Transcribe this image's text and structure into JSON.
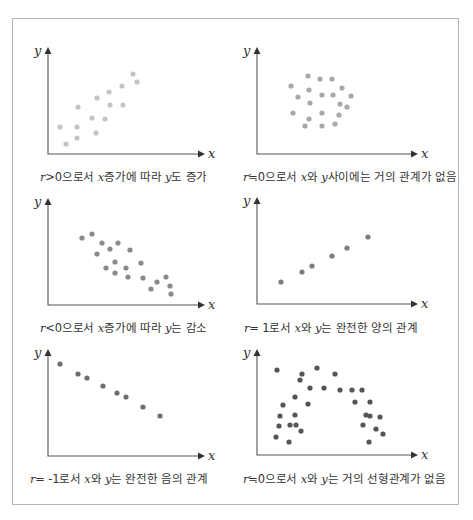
{
  "chart_data": [
    {
      "type": "scatter",
      "id": "panel1",
      "title": "",
      "xlabel": "x",
      "ylabel": "y",
      "caption": "r>0으로서 x증가에 따라 y도 증가",
      "dot_color": "#c4c4c4",
      "points": [
        [
          60,
          127
        ],
        [
          66,
          144
        ],
        [
          77,
          127
        ],
        [
          77,
          138
        ],
        [
          78,
          107
        ],
        [
          92,
          118
        ],
        [
          96,
          133
        ],
        [
          97,
          98
        ],
        [
          105,
          119
        ],
        [
          109,
          92
        ],
        [
          110,
          105
        ],
        [
          123,
          105
        ],
        [
          122,
          86
        ],
        [
          133,
          74
        ],
        [
          137,
          82
        ]
      ]
    },
    {
      "type": "scatter",
      "id": "panel2",
      "xlabel": "x",
      "ylabel": "y",
      "caption": "r≒0으로서 x와 y사이에는 거의 관계가 없음",
      "dot_color": "#a8a8a8",
      "points": [
        [
          291,
          86
        ],
        [
          308,
          76
        ],
        [
          320,
          79
        ],
        [
          332,
          79
        ],
        [
          298,
          97
        ],
        [
          309,
          90
        ],
        [
          322,
          95
        ],
        [
          333,
          95
        ],
        [
          342,
          88
        ],
        [
          351,
          96
        ],
        [
          310,
          103
        ],
        [
          340,
          104
        ],
        [
          347,
          107
        ],
        [
          293,
          113
        ],
        [
          322,
          113
        ],
        [
          339,
          115
        ],
        [
          309,
          119
        ],
        [
          305,
          126
        ],
        [
          322,
          126
        ],
        [
          335,
          124
        ]
      ]
    },
    {
      "type": "scatter",
      "id": "panel3",
      "xlabel": "x",
      "ylabel": "y",
      "caption": "r<0으로서 x증가에 따라 y는 감소",
      "dot_color": "#8a8a8a",
      "points": [
        [
          82,
          238
        ],
        [
          92,
          234
        ],
        [
          102,
          243
        ],
        [
          97,
          254
        ],
        [
          110,
          249
        ],
        [
          118,
          243
        ],
        [
          130,
          250
        ],
        [
          115,
          262
        ],
        [
          126,
          268
        ],
        [
          106,
          268
        ],
        [
          115,
          273
        ],
        [
          128,
          277
        ],
        [
          141,
          263
        ],
        [
          143,
          278
        ],
        [
          157,
          282
        ],
        [
          151,
          289
        ],
        [
          166,
          277
        ],
        [
          170,
          286
        ],
        [
          171,
          294
        ]
      ]
    },
    {
      "type": "scatter",
      "id": "panel4",
      "xlabel": "x",
      "ylabel": "y",
      "caption": "r= 1로서 x와 y는 완전한 양의 관계",
      "dot_color": "#7c7c7c",
      "points": [
        [
          281,
          282
        ],
        [
          302,
          272
        ],
        [
          312,
          266
        ],
        [
          332,
          256
        ],
        [
          347,
          248
        ],
        [
          368,
          237
        ]
      ]
    },
    {
      "type": "scatter",
      "id": "panel5",
      "xlabel": "x",
      "ylabel": "y",
      "caption": "r= -1로서 x와 y는 완전한 음의 관계",
      "dot_color": "#6e6e6e",
      "points": [
        [
          60,
          364
        ],
        [
          78,
          374
        ],
        [
          87,
          378
        ],
        [
          103,
          386
        ],
        [
          117,
          393
        ],
        [
          126,
          397
        ],
        [
          143,
          407
        ],
        [
          160,
          416
        ]
      ]
    },
    {
      "type": "scatter",
      "id": "panel6",
      "xlabel": "x",
      "ylabel": "y",
      "caption": "r≒0으로서 x와 y는 거의 선형관계가 없음",
      "dot_color": "#555555",
      "points": [
        [
          277,
          370
        ],
        [
          302,
          374
        ],
        [
          317,
          368
        ],
        [
          335,
          374
        ],
        [
          300,
          380
        ],
        [
          310,
          388
        ],
        [
          324,
          388
        ],
        [
          340,
          390
        ],
        [
          352,
          390
        ],
        [
          362,
          390
        ],
        [
          295,
          397
        ],
        [
          283,
          405
        ],
        [
          308,
          404
        ],
        [
          355,
          402
        ],
        [
          370,
          402
        ],
        [
          366,
          415
        ],
        [
          280,
          416
        ],
        [
          295,
          415
        ],
        [
          370,
          416
        ],
        [
          380,
          417
        ],
        [
          296,
          425
        ],
        [
          363,
          425
        ],
        [
          279,
          426
        ],
        [
          290,
          425
        ],
        [
          276,
          437
        ],
        [
          301,
          431
        ],
        [
          376,
          429
        ],
        [
          383,
          434
        ],
        [
          289,
          442
        ],
        [
          369,
          442
        ]
      ]
    }
  ],
  "panels": [
    {
      "caption": {
        "r": "r",
        "rel": ">0으로서 ",
        "x": "x",
        "mid": "증가에 따라 ",
        "y": "y",
        "end": "도 증가"
      }
    },
    {
      "caption": {
        "r": "r",
        "rel": "≒0으로서 ",
        "x": "x",
        "mid": "와 ",
        "y": "y",
        "end": "사이에는 거의 관계가 없음"
      }
    },
    {
      "caption": {
        "r": "r",
        "rel": "<0으로서 ",
        "x": "x",
        "mid": "증가에 따라 ",
        "y": "y",
        "end": "는 감소"
      }
    },
    {
      "caption": {
        "r": "r",
        "rel": "= 1로서 ",
        "x": "x",
        "mid": "와 ",
        "y": "y",
        "end": "는 완전한 양의 관계"
      }
    },
    {
      "caption": {
        "r": "r",
        "rel": "= -1로서 ",
        "x": "x",
        "mid": "와 ",
        "y": "y",
        "end": "는 완전한 음의 관계"
      }
    },
    {
      "caption": {
        "r": "r",
        "rel": "≒0으로서 ",
        "x": "x",
        "mid": "와 ",
        "y": "y",
        "end": "는 거의 선형관계가 없음"
      }
    }
  ],
  "axes": {
    "x_label": "x",
    "y_label": "y"
  }
}
